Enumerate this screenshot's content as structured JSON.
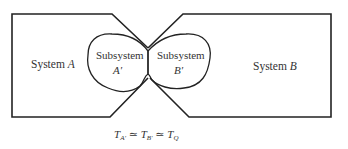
{
  "diagram": {
    "system_a": {
      "label_prefix": "System ",
      "label_var": "A"
    },
    "system_b": {
      "label_prefix": "System ",
      "label_var": "B"
    },
    "subsystem_a": {
      "line1": "Subsystem",
      "line2": "A′"
    },
    "subsystem_b": {
      "line1": "Subsystem",
      "line2": "B′"
    },
    "equation": {
      "t1": "T",
      "s1": "A′",
      "op1": " ≃ ",
      "t2": "T",
      "s2": "B′",
      "op2": " ≃ ",
      "t3": "T",
      "s3": "Q"
    },
    "colors": {
      "stroke": "#222222",
      "text": "#333333"
    }
  }
}
